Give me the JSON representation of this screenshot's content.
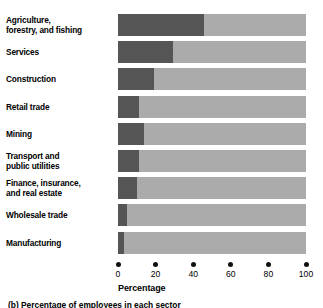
{
  "chart_data": {
    "type": "bar",
    "subtype": "horizontal-stacked-100",
    "title": "",
    "xlabel": "Percentage",
    "ylabel": "",
    "xlim": [
      0,
      100
    ],
    "grid": false,
    "legend": null,
    "categories": [
      "Agriculture,\nforestry, and fishing",
      "Services",
      "Construction",
      "Retail trade",
      "Mining",
      "Transport and\npublic utilities",
      "Finance, insurance,\nand real estate",
      "Wholesale trade",
      "Manufacturing"
    ],
    "series": [
      {
        "name": "dark-segment",
        "color": "#555555",
        "values": [
          46,
          29,
          19,
          11,
          14,
          11,
          10,
          5,
          3
        ]
      },
      {
        "name": "light-segment",
        "color": "#ababab",
        "values": [
          54,
          71,
          81,
          89,
          86,
          89,
          90,
          95,
          97
        ]
      }
    ],
    "xticks": [
      0,
      20,
      40,
      60,
      80,
      100
    ],
    "xtick_labels": [
      "0",
      "20",
      "40",
      "60",
      "80",
      "100"
    ]
  },
  "axis": {
    "title": "Percentage"
  },
  "caption": {
    "text": "(b) Percentage of employees in each sector"
  },
  "colors": {
    "dark": "#555555",
    "light": "#ababab",
    "text": "#000000",
    "background": "#ffffff"
  }
}
